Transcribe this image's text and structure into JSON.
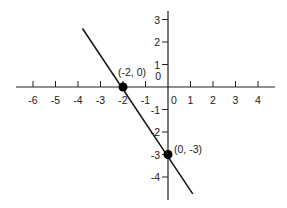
{
  "chart_data": {
    "type": "line",
    "title": "",
    "xlabel": "",
    "ylabel": "",
    "xlim": [
      -6.7,
      4.7
    ],
    "ylim": [
      -5,
      3.4
    ],
    "grid": false,
    "x_ticks": [
      "-6",
      "-5",
      "-4",
      "-3",
      "-2",
      "-1",
      "0",
      "1",
      "2",
      "3",
      "4"
    ],
    "y_ticks": [
      "3",
      "2",
      "1",
      "0",
      "-1",
      "-2",
      "-3",
      "-4"
    ],
    "series": [
      {
        "name": "line",
        "x": [
          -3.8,
          1.1
        ],
        "y": [
          2.6,
          -4.75
        ],
        "equation": "y = -1.5x - 3"
      }
    ],
    "points": [
      {
        "x": -2,
        "y": 0,
        "label": "(-2, 0)"
      },
      {
        "x": 0,
        "y": -3,
        "label": "(0, -3)"
      }
    ]
  }
}
